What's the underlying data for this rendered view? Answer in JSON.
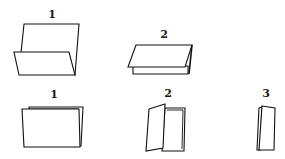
{
  "diagram": {
    "top_row": [
      {
        "label": "1",
        "description": "open folder with front flap folded up"
      },
      {
        "label": "2",
        "description": "sheet folded in half, lying flat"
      }
    ],
    "bottom_row": [
      {
        "label": "1",
        "description": "folded sheet viewed from front, closed"
      },
      {
        "label": "2",
        "description": "folded sheet standing, partially open"
      },
      {
        "label": "3",
        "description": "folded sheet standing, nearly closed"
      }
    ],
    "colors": {
      "line": "#111111",
      "paper": "#ffffff",
      "background": "#ffffff"
    }
  }
}
